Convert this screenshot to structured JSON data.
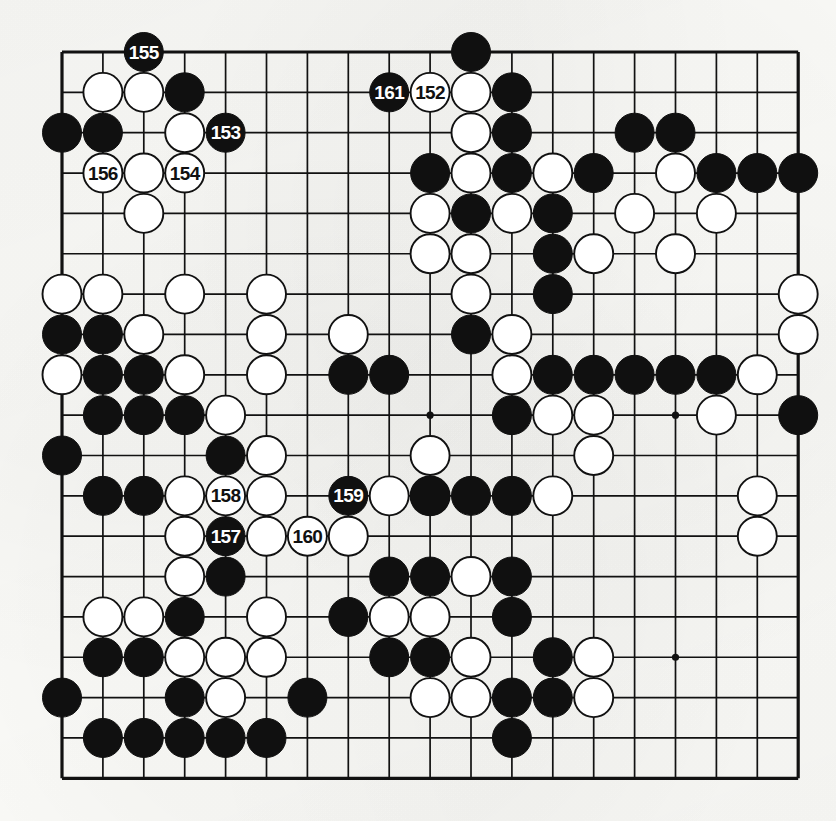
{
  "diagram": {
    "type": "go-board",
    "board_size": 19,
    "colors": {
      "line": "#111111",
      "black_stone": "#101010",
      "white_stone": "#ffffff",
      "white_stone_border": "#111111",
      "background": "#fbfbf8",
      "black_label_text": "#ffffff",
      "white_label_text": "#111111"
    },
    "geometry": {
      "origin_x": 62,
      "origin_y": 52,
      "step_x": 40.9,
      "step_y": 40.35,
      "stone_radius": 19.5,
      "border_width": 3.2,
      "line_width": 1.7
    },
    "star_points": [
      [
        3,
        3
      ],
      [
        9,
        3
      ],
      [
        15,
        3
      ],
      [
        3,
        9
      ],
      [
        9,
        9
      ],
      [
        15,
        9
      ],
      [
        3,
        15
      ],
      [
        9,
        15
      ],
      [
        15,
        15
      ]
    ],
    "numbered_moves": [
      {
        "label": "152",
        "color": "white",
        "col": 9,
        "row": 1
      },
      {
        "label": "153",
        "color": "black",
        "col": 4,
        "row": 2
      },
      {
        "label": "154",
        "color": "white",
        "col": 3,
        "row": 3
      },
      {
        "label": "155",
        "color": "black",
        "col": 2,
        "row": 0
      },
      {
        "label": "156",
        "color": "white",
        "col": 1,
        "row": 3
      },
      {
        "label": "157",
        "color": "black",
        "col": 4,
        "row": 12
      },
      {
        "label": "158",
        "color": "white",
        "col": 4,
        "row": 11
      },
      {
        "label": "159",
        "color": "black",
        "col": 7,
        "row": 11
      },
      {
        "label": "160",
        "color": "white",
        "col": 6,
        "row": 12
      },
      {
        "label": "161",
        "color": "black",
        "col": 8,
        "row": 1
      }
    ],
    "black_stones": [
      [
        10,
        0
      ],
      [
        3,
        1
      ],
      [
        11,
        1
      ],
      [
        0,
        2
      ],
      [
        1,
        2
      ],
      [
        11,
        2
      ],
      [
        14,
        2
      ],
      [
        15,
        2
      ],
      [
        9,
        3
      ],
      [
        11,
        3
      ],
      [
        13,
        3
      ],
      [
        16,
        3
      ],
      [
        17,
        3
      ],
      [
        18,
        3
      ],
      [
        10,
        4
      ],
      [
        12,
        4
      ],
      [
        12,
        5
      ],
      [
        12,
        6
      ],
      [
        0,
        7
      ],
      [
        1,
        7
      ],
      [
        10,
        7
      ],
      [
        1,
        8
      ],
      [
        2,
        8
      ],
      [
        7,
        8
      ],
      [
        8,
        8
      ],
      [
        12,
        8
      ],
      [
        13,
        8
      ],
      [
        14,
        8
      ],
      [
        15,
        8
      ],
      [
        16,
        8
      ],
      [
        1,
        9
      ],
      [
        2,
        9
      ],
      [
        3,
        9
      ],
      [
        11,
        9
      ],
      [
        18,
        9
      ],
      [
        0,
        10
      ],
      [
        4,
        10
      ],
      [
        1,
        11
      ],
      [
        2,
        11
      ],
      [
        9,
        11
      ],
      [
        10,
        11
      ],
      [
        11,
        11
      ],
      [
        4,
        13
      ],
      [
        8,
        13
      ],
      [
        9,
        13
      ],
      [
        11,
        13
      ],
      [
        3,
        14
      ],
      [
        7,
        14
      ],
      [
        11,
        14
      ],
      [
        1,
        15
      ],
      [
        2,
        15
      ],
      [
        8,
        15
      ],
      [
        9,
        15
      ],
      [
        12,
        15
      ],
      [
        0,
        16
      ],
      [
        3,
        16
      ],
      [
        6,
        16
      ],
      [
        11,
        16
      ],
      [
        12,
        16
      ],
      [
        1,
        17
      ],
      [
        2,
        17
      ],
      [
        3,
        17
      ],
      [
        4,
        17
      ],
      [
        5,
        17
      ],
      [
        11,
        17
      ]
    ],
    "white_stones": [
      [
        1,
        1
      ],
      [
        2,
        1
      ],
      [
        10,
        1
      ],
      [
        3,
        2
      ],
      [
        10,
        2
      ],
      [
        2,
        3
      ],
      [
        10,
        3
      ],
      [
        12,
        3
      ],
      [
        15,
        3
      ],
      [
        2,
        4
      ],
      [
        9,
        4
      ],
      [
        11,
        4
      ],
      [
        14,
        4
      ],
      [
        16,
        4
      ],
      [
        9,
        5
      ],
      [
        10,
        5
      ],
      [
        13,
        5
      ],
      [
        15,
        5
      ],
      [
        0,
        6
      ],
      [
        1,
        6
      ],
      [
        3,
        6
      ],
      [
        5,
        6
      ],
      [
        10,
        6
      ],
      [
        18,
        6
      ],
      [
        2,
        7
      ],
      [
        5,
        7
      ],
      [
        7,
        7
      ],
      [
        11,
        7
      ],
      [
        18,
        7
      ],
      [
        0,
        8
      ],
      [
        3,
        8
      ],
      [
        5,
        8
      ],
      [
        11,
        8
      ],
      [
        17,
        8
      ],
      [
        4,
        9
      ],
      [
        12,
        9
      ],
      [
        13,
        9
      ],
      [
        16,
        9
      ],
      [
        5,
        10
      ],
      [
        9,
        10
      ],
      [
        13,
        10
      ],
      [
        3,
        11
      ],
      [
        5,
        11
      ],
      [
        8,
        11
      ],
      [
        9,
        11
      ],
      [
        12,
        11
      ],
      [
        17,
        11
      ],
      [
        3,
        12
      ],
      [
        5,
        12
      ],
      [
        7,
        12
      ],
      [
        17,
        12
      ],
      [
        3,
        13
      ],
      [
        10,
        13
      ],
      [
        1,
        14
      ],
      [
        2,
        14
      ],
      [
        5,
        14
      ],
      [
        8,
        14
      ],
      [
        9,
        14
      ],
      [
        3,
        15
      ],
      [
        4,
        15
      ],
      [
        5,
        15
      ],
      [
        10,
        15
      ],
      [
        13,
        15
      ],
      [
        4,
        16
      ],
      [
        9,
        16
      ],
      [
        10,
        16
      ],
      [
        13,
        16
      ]
    ]
  }
}
